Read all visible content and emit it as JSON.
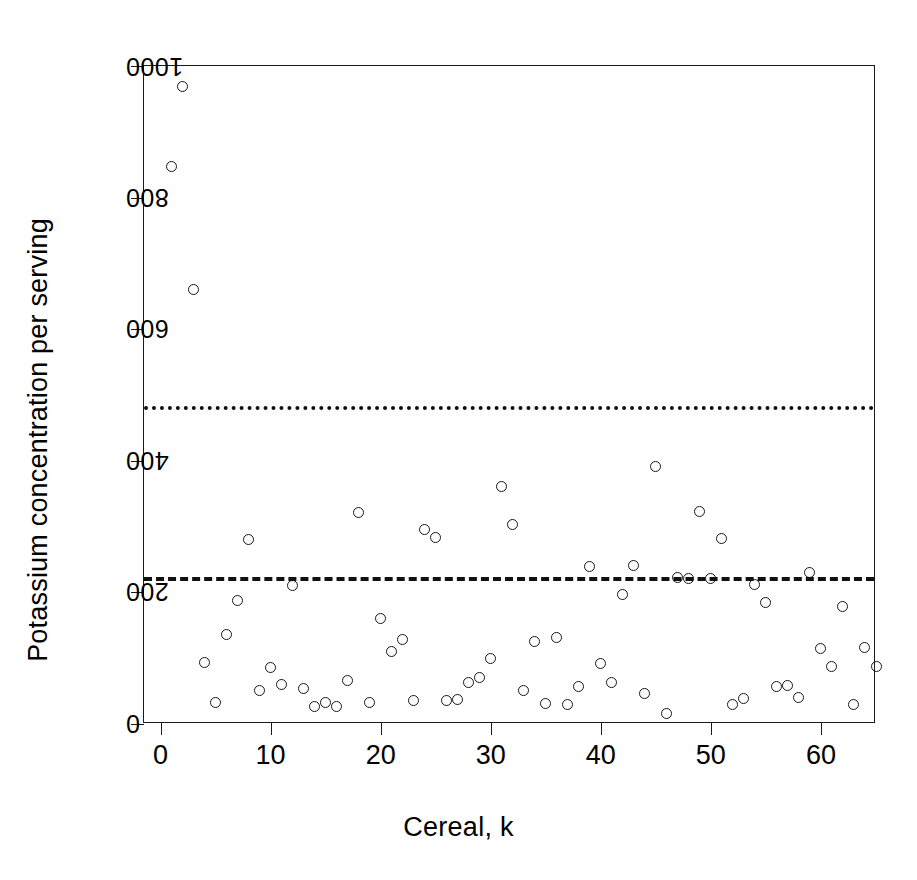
{
  "chart_data": {
    "type": "scatter",
    "title": "",
    "xlabel": "Cereal, k",
    "ylabel": "Potassium concentration per serving",
    "xlim": [
      -1.5,
      65.0
    ],
    "ylim": [
      0,
      1000
    ],
    "xticks": [
      0,
      10,
      20,
      30,
      40,
      50,
      60
    ],
    "yticks": [
      0,
      200,
      400,
      600,
      800,
      1000
    ],
    "grid": false,
    "legend": "none",
    "marker": "open-circle",
    "reference_lines": [
      {
        "name": "upper-threshold",
        "style": "dotted",
        "y": 480,
        "orientation": "horizontal"
      },
      {
        "name": "mean-line",
        "style": "dashed",
        "y": 220,
        "orientation": "horizontal"
      }
    ],
    "x": [
      1,
      2,
      3,
      4,
      5,
      6,
      7,
      8,
      9,
      10,
      11,
      12,
      13,
      14,
      15,
      16,
      17,
      18,
      19,
      20,
      21,
      22,
      23,
      24,
      25,
      26,
      27,
      28,
      29,
      30,
      31,
      32,
      33,
      34,
      35,
      36,
      37,
      38,
      39,
      40,
      41,
      42,
      43,
      44,
      45,
      46,
      47,
      48,
      49,
      50,
      51,
      52,
      53,
      54,
      55,
      56,
      57,
      58,
      59,
      60,
      61,
      62,
      63,
      64,
      65
    ],
    "y": [
      848,
      969,
      660,
      93,
      32,
      136,
      188,
      281,
      51,
      86,
      60,
      211,
      54,
      26,
      32,
      26,
      66,
      321,
      32,
      161,
      110,
      129,
      35,
      296,
      284,
      35,
      37,
      63,
      70,
      100,
      361,
      303,
      51,
      126,
      31,
      132,
      30,
      57,
      239,
      92,
      63,
      197,
      241,
      46,
      391,
      16,
      223,
      221,
      323,
      221,
      282,
      30,
      39,
      212,
      184,
      57,
      58,
      41,
      231,
      114,
      88,
      178,
      30,
      117,
      88
    ]
  },
  "axis": {
    "x_tick_labels": [
      "0",
      "10",
      "20",
      "30",
      "40",
      "50",
      "60"
    ],
    "y_tick_labels": [
      "0",
      "200",
      "400",
      "600",
      "800",
      "1000"
    ]
  },
  "colors": {
    "axis": "#1a1a1a",
    "marker_stroke": "#171717",
    "reference_line": "#111111",
    "background": "#ffffff"
  }
}
